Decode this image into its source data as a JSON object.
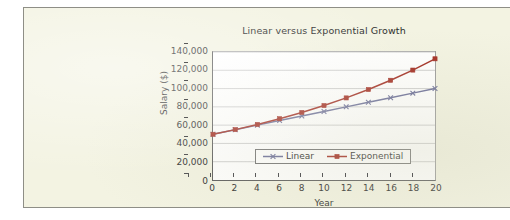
{
  "chart_data": {
    "type": "line",
    "title": "Linear versus Exponential Growth",
    "xlabel": "Year",
    "ylabel": "Salary ($)",
    "x": [
      0,
      2,
      4,
      6,
      8,
      10,
      12,
      14,
      16,
      18,
      20
    ],
    "xlim": [
      0,
      20
    ],
    "ylim": [
      0,
      140000
    ],
    "xticks": [
      "0",
      "2",
      "4",
      "6",
      "8",
      "10",
      "12",
      "14",
      "16",
      "18",
      "20"
    ],
    "yticks": [
      "0",
      "20,000",
      "40,000",
      "60,000",
      "80,000",
      "100,000",
      "120,000",
      "140,000"
    ],
    "ytick_values": [
      0,
      20000,
      40000,
      60000,
      80000,
      100000,
      120000,
      140000
    ],
    "grid": "horizontal",
    "legend_position": "lower center",
    "series": [
      {
        "name": "Linear",
        "color": "#6b6e99",
        "marker": "x",
        "values": [
          50000,
          55000,
          60000,
          65000,
          70000,
          75000,
          80000,
          85000,
          90000,
          95000,
          100000
        ]
      },
      {
        "name": "Exponential",
        "color": "#a22b20",
        "marker": "square",
        "values": [
          50000,
          55125,
          60775,
          67000,
          73875,
          81445,
          89775,
          98950,
          109070,
          120225,
          132545
        ]
      }
    ]
  },
  "page": {
    "background_color": "#f3f3e2",
    "border_color": "#8e8e86",
    "plot_background": "#ffffff",
    "axis_color": "#5a5a5a",
    "gridline_color": "#c9c9c9"
  }
}
